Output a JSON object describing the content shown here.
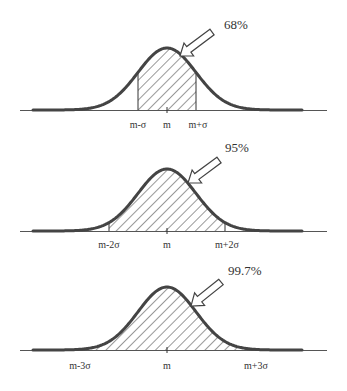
{
  "colors": {
    "curve": "#444444",
    "axis": "#555555",
    "hatch": "#333333",
    "text": "#333333"
  },
  "chart_data": [
    {
      "type": "area",
      "title": "68%",
      "description": "Normal curve with area between m-σ and m+σ shaded",
      "percent_label": "68%",
      "tick_labels": [
        "m-σ",
        "m",
        "m+σ"
      ],
      "shaded_range_sigma": [
        -1,
        1
      ],
      "shaded_area_percent": 68
    },
    {
      "type": "area",
      "title": "95%",
      "description": "Normal curve with area between m-2σ and m+2σ shaded",
      "percent_label": "95%",
      "tick_labels": [
        "m-2σ",
        "m",
        "m+2σ"
      ],
      "shaded_range_sigma": [
        -2,
        2
      ],
      "shaded_area_percent": 95
    },
    {
      "type": "area",
      "title": "99.7%",
      "description": "Normal curve with area between m-3σ and m+3σ shaded",
      "percent_label": "99.7%",
      "tick_labels": [
        "m-3σ",
        "m",
        "m+3σ"
      ],
      "shaded_range_sigma": [
        -3,
        3
      ],
      "shaded_area_percent": 99.7
    }
  ],
  "panels": [
    {
      "pct": "68%",
      "left": "m-σ",
      "mid": "m",
      "right": "m+σ"
    },
    {
      "pct": "95%",
      "left": "m-2σ",
      "mid": "m",
      "right": "m+2σ"
    },
    {
      "pct": "99.7%",
      "left": "m-3σ",
      "mid": "m",
      "right": "m+3σ"
    }
  ]
}
